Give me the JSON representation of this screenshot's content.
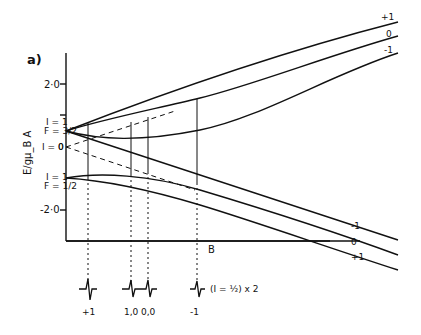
{
  "figure": {
    "panel_label": "a)",
    "y_axis_label": "E/gμ_B A",
    "x_axis_label": "B",
    "y_ticks": [
      "2·0",
      "-2·0"
    ],
    "level_labels": {
      "upper_group": {
        "I": "I = 1",
        "F": "F = 3/2"
      },
      "zero_level": {
        "I": "I = 0",
        "value": "0"
      },
      "lower_group": {
        "I": "I = 1",
        "F": "F = 1/2"
      }
    },
    "right_labels_upper": [
      "+1",
      "0",
      "-1"
    ],
    "right_labels_lower": [
      "-1",
      "0",
      "+1"
    ],
    "spectrum_labels": [
      "+1",
      "1,0",
      "0,0",
      "-1"
    ],
    "spectrum_annotation": "(I = ½) x 2"
  }
}
